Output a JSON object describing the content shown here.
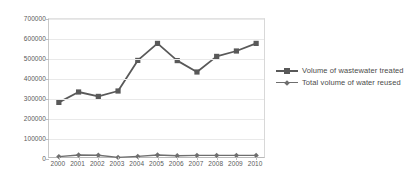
{
  "chart_data": {
    "type": "line",
    "title": "",
    "xlabel": "",
    "ylabel": "",
    "categories": [
      "2000",
      "2001",
      "2002",
      "2003",
      "2004",
      "2005",
      "2006",
      "2007",
      "2008",
      "2009",
      "2010"
    ],
    "ylim": [
      0,
      700000
    ],
    "ytick_labels": [
      "0",
      "100000",
      "200000",
      "300000",
      "400000",
      "500000",
      "600000",
      "700000"
    ],
    "ytick_values": [
      0,
      100000,
      200000,
      300000,
      400000,
      500000,
      600000,
      700000
    ],
    "grid": true,
    "legend_position": "right",
    "series": [
      {
        "name": "Volume of wastewater treated",
        "color": "#595959",
        "marker": "square",
        "values": [
          283000,
          335000,
          313000,
          340000,
          493000,
          578000,
          492000,
          435000,
          513000,
          540000,
          578000
        ]
      },
      {
        "name": "Total volume of water reused",
        "color": "#6e6e6e",
        "marker": "diamond",
        "values": [
          12000,
          20000,
          19000,
          8000,
          13000,
          20000,
          16000,
          18000,
          18000,
          18000,
          18000
        ]
      }
    ]
  },
  "legend": {
    "items": [
      {
        "label": "Volume of wastewater treated"
      },
      {
        "label": "Total volume of water reused"
      }
    ]
  },
  "colors": {
    "series_primary": "#595959",
    "series_secondary": "#6e6e6e",
    "gridline": "#e9e9e9",
    "axis": "#bdbdbd",
    "text": "#5a5a5a",
    "background": "#ffffff"
  }
}
